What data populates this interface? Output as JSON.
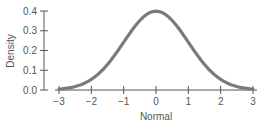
{
  "chart_data": {
    "type": "line",
    "title": "",
    "xlabel": "Normal",
    "ylabel": "Density",
    "xlim": [
      -3,
      3
    ],
    "ylim": [
      0,
      0.4
    ],
    "x_ticks": [
      "-3",
      "-2",
      "-1",
      "0",
      "1",
      "2",
      "3"
    ],
    "y_ticks": [
      "0.0",
      "0.1",
      "0.2",
      "0.3",
      "0.4"
    ],
    "grid": false,
    "legend": null,
    "series": [
      {
        "name": "Standard normal density",
        "x": [
          -3,
          -2.5,
          -2,
          -1.5,
          -1,
          -0.5,
          0,
          0.5,
          1,
          1.5,
          2,
          2.5,
          3
        ],
        "y": [
          0.004,
          0.018,
          0.054,
          0.13,
          0.242,
          0.352,
          0.399,
          0.352,
          0.242,
          0.13,
          0.054,
          0.018,
          0.004
        ]
      }
    ],
    "colors": {
      "curve": "#7a7a7a",
      "axis": "#555555"
    }
  }
}
